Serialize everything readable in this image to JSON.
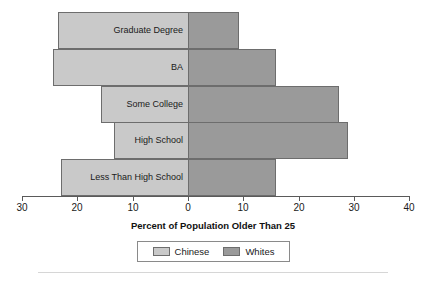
{
  "chart_data": {
    "type": "bar",
    "orientation": "horizontal-diverging",
    "title": "",
    "xlabel": "Percent of Population Older Than 25",
    "ylabel": "",
    "categories": [
      "Graduate Degree",
      "BA",
      "Some College",
      "High School",
      "Less Than High School"
    ],
    "series": [
      {
        "name": "Chinese",
        "color": "#c9c9c9",
        "side": "left",
        "values": [
          23.5,
          24.4,
          15.7,
          13.4,
          23.0
        ]
      },
      {
        "name": "Whites",
        "color": "#9a9a9a",
        "side": "right",
        "values": [
          9.2,
          15.9,
          27.3,
          28.9,
          15.9
        ]
      }
    ],
    "axis": {
      "tick_labels": [
        "30",
        "20",
        "10",
        "0",
        "10",
        "20",
        "30",
        "40"
      ],
      "tick_values": [
        -30,
        -20,
        -10,
        0,
        10,
        20,
        30,
        40
      ],
      "xlim": [
        -30,
        40
      ],
      "zero_value": 0,
      "grid": false
    },
    "legend": {
      "position": "bottom-center",
      "entries": [
        {
          "label": "Chinese",
          "color": "#c9c9c9"
        },
        {
          "label": "Whites",
          "color": "#9a9a9a"
        }
      ]
    }
  },
  "colors": {
    "chinese": "#c9c9c9",
    "whites": "#9a9a9a",
    "bar_border": "#6d6d6d",
    "axis": "#5a5a5a",
    "text": "#1a1a1a",
    "background": "#ffffff"
  }
}
